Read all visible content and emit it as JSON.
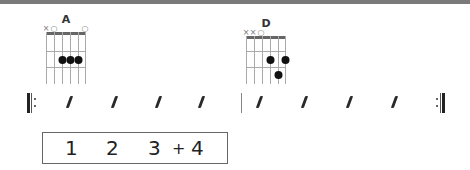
{
  "chords": [
    {
      "name": "A",
      "string_marks": [
        "×",
        "○",
        "",
        "",
        "",
        "○"
      ],
      "dots": [
        {
          "string": 3,
          "fret": 2
        },
        {
          "string": 4,
          "fret": 2
        },
        {
          "string": 5,
          "fret": 2
        }
      ]
    },
    {
      "name": "D",
      "string_marks": [
        "×",
        "×",
        "○",
        "",
        "",
        ""
      ],
      "dots": [
        {
          "string": 4,
          "fret": 2
        },
        {
          "string": 6,
          "fret": 2
        },
        {
          "string": 5,
          "fret": 3
        }
      ]
    }
  ],
  "measures": [
    {
      "beats": 4,
      "symbol": "/"
    },
    {
      "beats": 4,
      "symbol": "/"
    }
  ],
  "repeat": {
    "start": true,
    "end": true
  },
  "counting": [
    "1",
    "2",
    "3",
    "+",
    "4"
  ],
  "colors": {
    "ink": "#2a2a2a",
    "grid": "#999999",
    "nut": "#666666",
    "topband": "#7a7a7a"
  }
}
